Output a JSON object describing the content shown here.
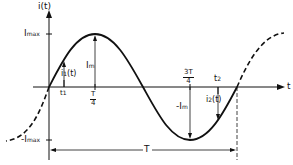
{
  "diagram": {
    "type": "sinusoidal current waveform",
    "y_axis_label": "i(t)",
    "x_axis_label": "t",
    "labels": {
      "imax": "I",
      "imax_sub": "max",
      "neg_imax": "-I",
      "neg_imax_sub": "max",
      "im": "I",
      "im_sub": "m",
      "neg_im": "-I",
      "neg_im_sub": "m",
      "i1": "i",
      "i1_sub": "1",
      "i1_arg": "(t)",
      "i2": "i",
      "i2_sub": "2",
      "i2_arg": "(t)",
      "t1": "t",
      "t1_sub": "1",
      "t2": "t",
      "t2_sub": "2",
      "quarter_num": "T",
      "quarter_den": "4",
      "threequarter_num": "3T",
      "threequarter_den": "4",
      "period": "T"
    },
    "colors": {
      "stroke": "#111111",
      "background": "#ffffff"
    }
  }
}
